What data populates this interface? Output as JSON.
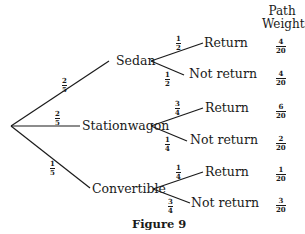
{
  "header": {
    "line1": "Path",
    "line2": "Weights"
  },
  "root": {
    "x": 11,
    "y": 126
  },
  "first_level": [
    {
      "label": "Sedan",
      "prob": {
        "num": "2",
        "den": "5"
      }
    },
    {
      "label": "Stationwagon",
      "prob": {
        "num": "2",
        "den": "5"
      }
    },
    {
      "label": "Convertible",
      "prob": {
        "num": "1",
        "den": "5"
      }
    }
  ],
  "second_level": [
    {
      "parent": "Sedan",
      "outcome": "Return",
      "prob": {
        "num": "1",
        "den": "2"
      },
      "weight": {
        "num": "4",
        "den": "20"
      }
    },
    {
      "parent": "Sedan",
      "outcome": "Not return",
      "prob": {
        "num": "1",
        "den": "2"
      },
      "weight": {
        "num": "4",
        "den": "20"
      }
    },
    {
      "parent": "Stationwagon",
      "outcome": "Return",
      "prob": {
        "num": "3",
        "den": "4"
      },
      "weight": {
        "num": "6",
        "den": "20"
      }
    },
    {
      "parent": "Stationwagon",
      "outcome": "Not return",
      "prob": {
        "num": "1",
        "den": "4"
      },
      "weight": {
        "num": "2",
        "den": "20"
      }
    },
    {
      "parent": "Convertible",
      "outcome": "Return",
      "prob": {
        "num": "1",
        "den": "4"
      },
      "weight": {
        "num": "1",
        "den": "20"
      }
    },
    {
      "parent": "Convertible",
      "outcome": "Not return",
      "prob": {
        "num": "3",
        "den": "4"
      },
      "weight": {
        "num": "3",
        "den": "20"
      }
    }
  ],
  "caption": "Figure 9"
}
